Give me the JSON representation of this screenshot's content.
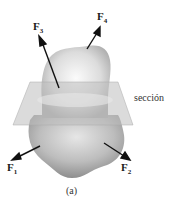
{
  "figure": {
    "caption": "(a)",
    "section_label": "sección",
    "forces": [
      {
        "name": "F",
        "sub": "1"
      },
      {
        "name": "F",
        "sub": "2"
      },
      {
        "name": "F",
        "sub": "3"
      },
      {
        "name": "F",
        "sub": "4"
      }
    ],
    "colors": {
      "body": "#b8b8b8",
      "body_highlight": "#f2f2f2",
      "plane": "#c9c9c9",
      "arrow": "#111111"
    }
  }
}
